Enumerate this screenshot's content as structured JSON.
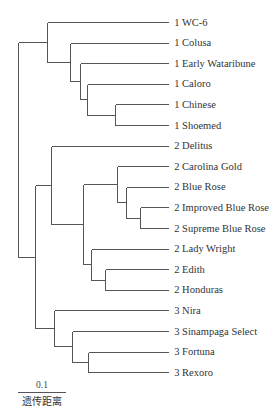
{
  "diagram": {
    "type": "dendrogram",
    "orientation": "left-to-right",
    "leaves": [
      {
        "group": "1",
        "name": "WC-6"
      },
      {
        "group": "1",
        "name": "Colusa"
      },
      {
        "group": "1",
        "name": "Early Wataribune"
      },
      {
        "group": "1",
        "name": "Caloro"
      },
      {
        "group": "1",
        "name": "Chinese"
      },
      {
        "group": "1",
        "name": "Shoemed"
      },
      {
        "group": "2",
        "name": "Delitus"
      },
      {
        "group": "2",
        "name": "Carolina Gold"
      },
      {
        "group": "2",
        "name": "Blue Rose"
      },
      {
        "group": "2",
        "name": "Improved Blue Rose"
      },
      {
        "group": "2",
        "name": "Supreme Blue Rose"
      },
      {
        "group": "2",
        "name": "Lady Wright"
      },
      {
        "group": "2",
        "name": "Edith"
      },
      {
        "group": "2",
        "name": "Honduras"
      },
      {
        "group": "3",
        "name": "Nira"
      },
      {
        "group": "3",
        "name": "Sinampaga Select"
      },
      {
        "group": "3",
        "name": "Fortuna"
      },
      {
        "group": "3",
        "name": "Rexoro"
      }
    ],
    "tree": {
      "height": 0.0,
      "children": [
        {
          "height": 0.06,
          "children": [
            {
              "leaf": 0
            },
            {
              "height": 0.108,
              "children": [
                {
                  "leaf": 1
                },
                {
                  "height": 0.129,
                  "children": [
                    {
                      "leaf": 2
                    },
                    {
                      "height": 0.144,
                      "children": [
                        {
                          "leaf": 3
                        },
                        {
                          "height": 0.202,
                          "children": [
                            {
                              "leaf": 4
                            },
                            {
                              "leaf": 5
                            }
                          ]
                        }
                      ]
                    }
                  ]
                }
              ]
            }
          ]
        },
        {
          "height": 0.035,
          "children": [
            {
              "height": 0.069,
              "children": [
                {
                  "leaf": 6
                },
                {
                  "height": 0.135,
                  "children": [
                    {
                      "height": 0.206,
                      "children": [
                        {
                          "leaf": 7
                        },
                        {
                          "height": 0.225,
                          "children": [
                            {
                              "leaf": 8
                            },
                            {
                              "height": 0.254,
                              "children": [
                                {
                                  "leaf": 9
                                },
                                {
                                  "leaf": 10
                                }
                              ]
                            }
                          ]
                        }
                      ]
                    },
                    {
                      "height": 0.152,
                      "children": [
                        {
                          "leaf": 11
                        },
                        {
                          "height": 0.181,
                          "children": [
                            {
                              "leaf": 12
                            },
                            {
                              "leaf": 13
                            }
                          ]
                        }
                      ]
                    }
                  ]
                }
              ]
            },
            {
              "height": 0.075,
              "children": [
                {
                  "leaf": 14
                },
                {
                  "height": 0.112,
                  "children": [
                    {
                      "leaf": 15
                    },
                    {
                      "height": 0.146,
                      "children": [
                        {
                          "leaf": 16
                        },
                        {
                          "leaf": 17
                        }
                      ]
                    }
                  ]
                }
              ]
            }
          ]
        }
      ]
    },
    "leaf_distance": 0.313,
    "scale_bar": {
      "value": 0.1,
      "value_label": "0.1",
      "caption": "遗传距离"
    }
  }
}
